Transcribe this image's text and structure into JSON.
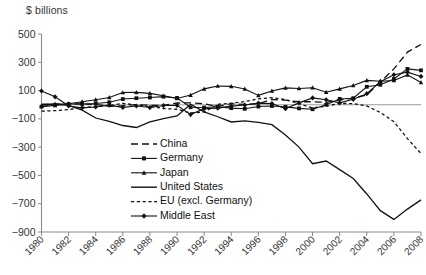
{
  "chart_data": {
    "type": "line",
    "title": "",
    "ylabel": "$ billions",
    "xlabel": "",
    "ylim": [
      -900,
      500
    ],
    "ytick_values": [
      500,
      300,
      100,
      -100,
      -300,
      -500,
      -700,
      -900
    ],
    "ytick_labels": [
      "500",
      "300",
      "100",
      "−100",
      "−300",
      "−500",
      "−700",
      "−900"
    ],
    "xlim": [
      1980,
      2008
    ],
    "x": [
      1980,
      1981,
      1982,
      1983,
      1984,
      1985,
      1986,
      1987,
      1988,
      1989,
      1990,
      1991,
      1992,
      1993,
      1994,
      1995,
      1996,
      1997,
      1998,
      1999,
      2000,
      2001,
      2002,
      2003,
      2004,
      2005,
      2006,
      2007,
      2008
    ],
    "xtick_values": [
      1980,
      1982,
      1984,
      1986,
      1988,
      1990,
      1992,
      1994,
      1996,
      1998,
      2000,
      2002,
      2004,
      2006,
      2008
    ],
    "xtick_labels": [
      "1980",
      "1982",
      "1984",
      "1986",
      "1988",
      "1990",
      "1992",
      "1994",
      "1996",
      "1998",
      "2000",
      "2002",
      "2004",
      "2006",
      "2008"
    ],
    "grid": false,
    "legend_position": "center-bottom-left",
    "series": [
      {
        "name": "China",
        "style": "dashed",
        "marker": "none",
        "color": "#111111",
        "values": [
          2,
          2,
          6,
          5,
          2,
          -11,
          -7,
          0,
          -4,
          -4,
          12,
          13,
          6,
          -12,
          8,
          2,
          7,
          37,
          32,
          21,
          21,
          17,
          35,
          46,
          69,
          161,
          253,
          372,
          426
        ]
      },
      {
        "name": "Germany",
        "style": "solid",
        "marker": "square",
        "color": "#111111",
        "values": [
          -14,
          -5,
          5,
          5,
          9,
          17,
          40,
          46,
          51,
          57,
          48,
          -18,
          -20,
          -14,
          -24,
          -29,
          -13,
          -9,
          -15,
          -26,
          -32,
          0,
          41,
          46,
          127,
          141,
          182,
          253,
          243
        ]
      },
      {
        "name": "Japan",
        "style": "solid",
        "marker": "triangle",
        "color": "#111111",
        "values": [
          -11,
          5,
          7,
          21,
          35,
          51,
          86,
          87,
          80,
          63,
          44,
          68,
          112,
          132,
          130,
          111,
          66,
          97,
          119,
          115,
          120,
          88,
          112,
          136,
          172,
          166,
          171,
          211,
          157
        ]
      },
      {
        "name": "United States",
        "style": "solid",
        "marker": "none",
        "color": "#111111",
        "values": [
          2,
          5,
          -5,
          -38,
          -94,
          -118,
          -147,
          -161,
          -121,
          -99,
          -79,
          3,
          -50,
          -85,
          -122,
          -114,
          -125,
          -141,
          -214,
          -300,
          -417,
          -398,
          -459,
          -522,
          -631,
          -749,
          -811,
          -738,
          -673
        ]
      },
      {
        "name": "EU (excl. Germany)",
        "style": "dotted",
        "marker": "none",
        "color": "#111111",
        "values": [
          -45,
          -42,
          -34,
          -20,
          -14,
          -6,
          10,
          -3,
          -12,
          -27,
          -32,
          -58,
          -52,
          3,
          11,
          22,
          41,
          50,
          36,
          8,
          -23,
          -10,
          9,
          8,
          -9,
          -55,
          -120,
          -240,
          -345
        ]
      },
      {
        "name": "Middle East",
        "style": "solid",
        "marker": "diamond",
        "color": "#111111",
        "values": [
          97,
          56,
          -9,
          -22,
          -16,
          -3,
          -19,
          -9,
          -20,
          -6,
          -4,
          -70,
          -28,
          -24,
          -10,
          -2,
          11,
          8,
          -28,
          13,
          48,
          35,
          13,
          38,
          78,
          163,
          212,
          230,
          200
        ]
      }
    ]
  },
  "legend": {
    "items": [
      {
        "label": "China"
      },
      {
        "label": "Germany"
      },
      {
        "label": "Japan"
      },
      {
        "label": "United States"
      },
      {
        "label": "EU (excl. Germany)"
      },
      {
        "label": "Middle East"
      }
    ]
  }
}
